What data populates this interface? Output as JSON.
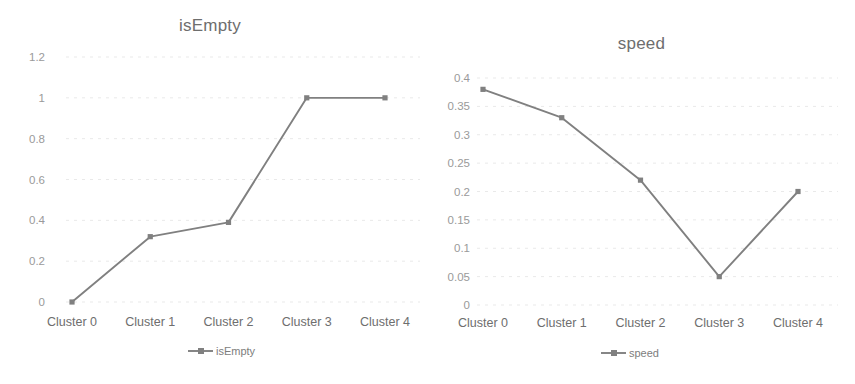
{
  "page": {
    "background_color": "#ffffff",
    "line_color": "#808080",
    "grid_color": "#e9e9e9",
    "text_color": "#6e6e6e",
    "tick_color": "#9a9a9a"
  },
  "charts": [
    {
      "id": "isempty-chart",
      "title": "isEmpty",
      "type": "line",
      "categories": [
        "Cluster 0",
        "Cluster 1",
        "Cluster 2",
        "Cluster 3",
        "Cluster 4"
      ],
      "series_name": "isEmpty",
      "values": [
        0,
        0.32,
        0.39,
        1,
        1
      ],
      "y_ticks": [
        "1.2",
        "1",
        "0.8",
        "0.6",
        "0.4",
        "0.2",
        "0"
      ],
      "y_tick_values": [
        1.2,
        1,
        0.8,
        0.6,
        0.4,
        0.2,
        0
      ],
      "ylim": [
        0,
        1.2
      ],
      "xlabel": "",
      "ylabel": "",
      "legend_label": "isEmpty",
      "legend_position": "bottom",
      "grid": true
    },
    {
      "id": "speed-chart",
      "title": "speed",
      "type": "line",
      "categories": [
        "Cluster 0",
        "Cluster 1",
        "Cluster 2",
        "Cluster 3",
        "Cluster 4"
      ],
      "series_name": "speed",
      "values": [
        0.38,
        0.33,
        0.22,
        0.05,
        0.2
      ],
      "y_ticks": [
        "0.4",
        "0.35",
        "0.3",
        "0.25",
        "0.2",
        "0.15",
        "0.1",
        "0.05",
        "0"
      ],
      "y_tick_values": [
        0.4,
        0.35,
        0.3,
        0.25,
        0.2,
        0.15,
        0.1,
        0.05,
        0
      ],
      "ylim": [
        0,
        0.4
      ],
      "xlabel": "",
      "ylabel": "",
      "legend_label": "speed",
      "legend_position": "bottom",
      "grid": true
    }
  ],
  "chart_data": [
    {
      "type": "line",
      "title": "isEmpty",
      "categories": [
        "Cluster 0",
        "Cluster 1",
        "Cluster 2",
        "Cluster 3",
        "Cluster 4"
      ],
      "series": [
        {
          "name": "isEmpty",
          "values": [
            0,
            0.32,
            0.39,
            1,
            1
          ]
        }
      ],
      "xlabel": "",
      "ylabel": "",
      "ylim": [
        0,
        1.2
      ],
      "yticks": [
        0,
        0.2,
        0.4,
        0.6,
        0.8,
        1,
        1.2
      ],
      "grid": true,
      "legend": "bottom-center"
    },
    {
      "type": "line",
      "title": "speed",
      "categories": [
        "Cluster 0",
        "Cluster 1",
        "Cluster 2",
        "Cluster 3",
        "Cluster 4"
      ],
      "series": [
        {
          "name": "speed",
          "values": [
            0.38,
            0.33,
            0.22,
            0.05,
            0.2
          ]
        }
      ],
      "xlabel": "",
      "ylabel": "",
      "ylim": [
        0,
        0.4
      ],
      "yticks": [
        0,
        0.05,
        0.1,
        0.15,
        0.2,
        0.25,
        0.3,
        0.35,
        0.4
      ],
      "grid": true,
      "legend": "bottom-center"
    }
  ]
}
